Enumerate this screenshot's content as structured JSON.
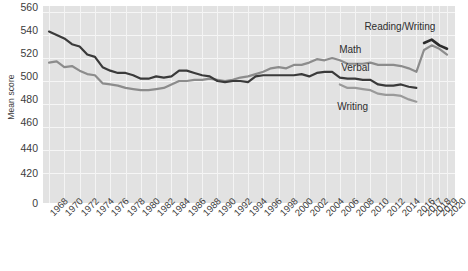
{
  "chart_data": {
    "type": "line",
    "title": "",
    "xlabel": "",
    "ylabel": "Mean score",
    "ylim": [
      420,
      560
    ],
    "y_axis_break": true,
    "y_ticks": [
      560,
      540,
      520,
      500,
      480,
      460,
      440,
      420,
      0
    ],
    "grid": true,
    "legend_position": "inline-annotations",
    "x_tick_labels": [
      "1968",
      "1970",
      "1972",
      "1974",
      "1976",
      "1978",
      "1980",
      "1982",
      "1984",
      "1986",
      "1988",
      "1990",
      "1992",
      "1994",
      "1996",
      "1998",
      "2000",
      "2002",
      "2004",
      "2006",
      "2008",
      "2010",
      "2012",
      "2014",
      "2016",
      "2017",
      "2018",
      "2019",
      "2020"
    ],
    "series": [
      {
        "name": "Math",
        "color": "#8c8c8c",
        "label_text": "Math",
        "x": [
          1968,
          1969,
          1970,
          1971,
          1972,
          1973,
          1974,
          1975,
          1976,
          1977,
          1978,
          1979,
          1980,
          1981,
          1982,
          1983,
          1984,
          1985,
          1986,
          1987,
          1988,
          1989,
          1990,
          1991,
          1992,
          1993,
          1994,
          1995,
          1996,
          1997,
          1998,
          1999,
          2000,
          2001,
          2002,
          2003,
          2004,
          2005,
          2006,
          2007,
          2008,
          2009,
          2010,
          2011,
          2012,
          2013,
          2014,
          2015,
          2016,
          2017,
          2018,
          2019,
          2020
        ],
        "values": [
          516,
          517,
          512,
          513,
          509,
          506,
          505,
          498,
          497,
          496,
          494,
          493,
          492,
          492,
          493,
          494,
          497,
          500,
          500,
          501,
          501,
          502,
          501,
          500,
          501,
          503,
          504,
          506,
          508,
          511,
          512,
          511,
          514,
          514,
          516,
          519,
          518,
          520,
          518,
          515,
          515,
          515,
          516,
          514,
          514,
          514,
          513,
          511,
          508,
          527,
          531,
          528,
          523
        ]
      },
      {
        "name": "Verbal",
        "color": "#3a3a3a",
        "label_text": "Verbal",
        "x": [
          1968,
          1969,
          1970,
          1971,
          1972,
          1973,
          1974,
          1975,
          1976,
          1977,
          1978,
          1979,
          1980,
          1981,
          1982,
          1983,
          1984,
          1985,
          1986,
          1987,
          1988,
          1989,
          1990,
          1991,
          1992,
          1993,
          1994,
          1995,
          1996,
          1997,
          1998,
          1999,
          2000,
          2001,
          2002,
          2003,
          2004,
          2005,
          2006,
          2007,
          2008,
          2009,
          2010,
          2011,
          2012,
          2013,
          2014,
          2015,
          2016
        ],
        "values": [
          543,
          540,
          537,
          532,
          530,
          523,
          521,
          512,
          509,
          507,
          507,
          505,
          502,
          502,
          504,
          503,
          504,
          509,
          509,
          507,
          505,
          504,
          500,
          499,
          500,
          500,
          499,
          504,
          505,
          505,
          505,
          505,
          505,
          506,
          504,
          507,
          508,
          508,
          503,
          502,
          502,
          501,
          501,
          497,
          496,
          496,
          497,
          495,
          494
        ]
      },
      {
        "name": "Writing",
        "color": "#9a9a9a",
        "label_text": "Writing",
        "x": [
          2006,
          2007,
          2008,
          2009,
          2010,
          2011,
          2012,
          2013,
          2014,
          2015,
          2016
        ],
        "values": [
          497,
          494,
          494,
          493,
          492,
          489,
          488,
          488,
          487,
          484,
          482
        ]
      },
      {
        "name": "Reading/Writing",
        "color": "#2b2b2b",
        "label_text": "Reading/Writing",
        "x": [
          2017,
          2018,
          2019,
          2020
        ],
        "values": [
          533,
          536,
          531,
          528
        ]
      }
    ]
  },
  "axis": {
    "y_title": "Mean score",
    "y_ticks": [
      "560",
      "540",
      "520",
      "500",
      "480",
      "460",
      "440",
      "420",
      "0"
    ]
  }
}
